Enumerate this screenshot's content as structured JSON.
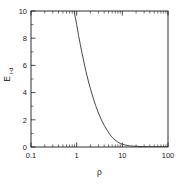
{
  "chart_data": {
    "type": "line",
    "title": "",
    "xlabel": "ρ",
    "ylabel_main": "E",
    "ylabel_sub": "i-d",
    "xscale": "log",
    "yscale": "linear",
    "xlim": [
      0.1,
      100
    ],
    "ylim": [
      0,
      10
    ],
    "grid": false,
    "legend": null,
    "xticks": [
      0.1,
      1,
      10,
      100
    ],
    "xtick_labels": [
      "0.1",
      "1",
      "10",
      "100"
    ],
    "yticks": [
      0,
      2,
      4,
      6,
      8,
      10
    ],
    "ytick_labels": [
      "0",
      "2",
      "4",
      "6",
      "8",
      "10"
    ],
    "series": [
      {
        "name": "E_i-d",
        "color": "#333333",
        "x": [
          0.88,
          0.95,
          1.0,
          1.1,
          1.2,
          1.3,
          1.45,
          1.6,
          1.8,
          2.0,
          2.3,
          2.6,
          3.0,
          3.5,
          4.0,
          4.6,
          5.3,
          6.0,
          7.0,
          8.0,
          9.0,
          10.0,
          12.0,
          15.0,
          20.0,
          30.0,
          50.0,
          100.0
        ],
        "y": [
          10.0,
          9.4,
          9.0,
          8.2,
          7.55,
          6.95,
          6.2,
          5.55,
          4.85,
          4.3,
          3.6,
          3.05,
          2.5,
          1.98,
          1.6,
          1.25,
          0.93,
          0.72,
          0.5,
          0.36,
          0.26,
          0.2,
          0.13,
          0.08,
          0.05,
          0.03,
          0.015,
          0.01
        ]
      }
    ]
  },
  "axes": {
    "xtick_labels": [
      "0.1",
      "1",
      "10",
      "100"
    ],
    "ytick_labels": [
      "10",
      "8",
      "6",
      "4",
      "2",
      "0"
    ],
    "xlabel": "ρ",
    "ylabel_main": "E",
    "ylabel_sub": "i-d"
  },
  "colors": {
    "background": "#ffffff",
    "axis": "#1a1a1a",
    "curve": "#333333"
  }
}
